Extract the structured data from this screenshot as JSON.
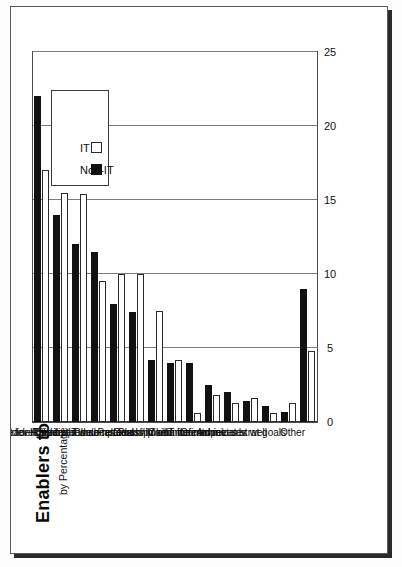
{
  "page": {
    "frame_color": "#5a5a5a",
    "background": "#ffffff"
  },
  "chart_data": {
    "type": "bar",
    "orientation": "vertical",
    "title": "Enablers to Alignment",
    "subtitle": "by Percentage",
    "xlabel": "",
    "ylabel": "",
    "ylim": [
      0,
      25
    ],
    "ticks": [
      "0",
      "5",
      "10",
      "15",
      "20",
      "25"
    ],
    "grid": true,
    "legend_position": "top-right",
    "categories": [
      "Exec support for IT",
      "Strategy developed",
      "Leadership by IT",
      "Prioritizes well",
      "Shares resources",
      "Understand comp/cust",
      "Close relationship",
      "Plans linked",
      "Partnership / alliance",
      "Goals / Vision defined",
      "Commitments met",
      "IT for compet. adv.",
      "Communicates well",
      "Achieves strat goals",
      "Other"
    ],
    "series": [
      {
        "name": "Non-IT",
        "color": "#111111",
        "values": [
          22,
          14,
          12,
          11.5,
          8,
          7.4,
          4.2,
          4,
          4,
          2.5,
          2,
          1.4,
          1.1,
          0.7,
          9
        ]
      },
      {
        "name": "IT",
        "color": "#ffffff",
        "values": [
          17,
          15.5,
          15.4,
          9.5,
          10,
          10,
          7.5,
          4.2,
          0.6,
          1.8,
          1.3,
          1.6,
          0.6,
          1.3,
          4.8
        ]
      }
    ]
  },
  "legend": {
    "entries": [
      {
        "label": "Non-IT",
        "swatch": "filled"
      },
      {
        "label": "IT",
        "swatch": "hollow"
      }
    ]
  }
}
